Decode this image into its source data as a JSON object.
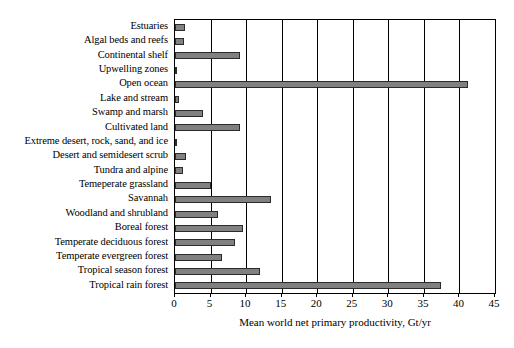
{
  "chart_data": {
    "type": "bar",
    "orientation": "horizontal",
    "title": "",
    "subtitle": "",
    "xlabel": "Mean world net primary productivity, Gt/yr",
    "ylabel": "",
    "xlim": [
      0,
      45
    ],
    "xticks": [
      0,
      5,
      10,
      15,
      20,
      25,
      30,
      35,
      40,
      45
    ],
    "xtick_labels": [
      "0",
      "5",
      "10",
      "15",
      "20",
      "25",
      "30",
      "35",
      "40",
      "45"
    ],
    "grid": "vertical",
    "legend": "none",
    "bar_color": "#808080",
    "bar_edge_color": "#2b2b2b",
    "plot_border_color": "#000000",
    "background": "#ffffff",
    "categories": [
      "Estuaries",
      "Algal beds and reefs",
      "Continental shelf",
      "Upwelling zones",
      "Open ocean",
      "Lake and stream",
      "Swamp and marsh",
      "Cultivated land",
      "Extreme desert, rock, sand, and ice",
      "Desert and semidesert scrub",
      "Tundra and alpine",
      "Temeperate grassland",
      "Savannah",
      "Woodland and shrubland",
      "Boreal forest",
      "Temperate deciduous forest",
      "Temperate evergreen forest",
      "Tropical season forest",
      "Tropical rain forest"
    ],
    "values": [
      1.4,
      1.2,
      9.2,
      0.2,
      41.2,
      0.6,
      4.0,
      9.1,
      0.07,
      1.6,
      1.1,
      5.0,
      13.5,
      6.0,
      9.6,
      8.4,
      6.6,
      12.0,
      37.4
    ]
  }
}
